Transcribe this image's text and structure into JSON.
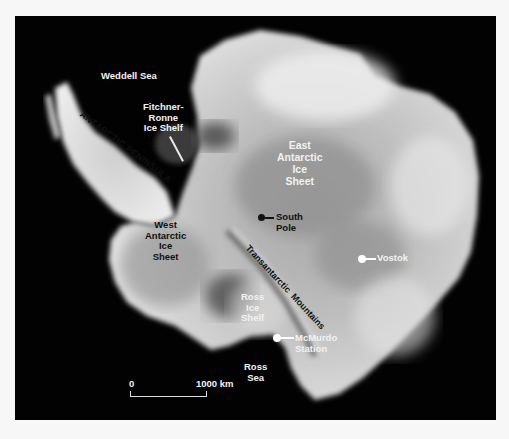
{
  "map": {
    "title": "Antarctica satellite mosaic",
    "colors": {
      "ocean": "#020202",
      "ice_light": "#e8e8e8",
      "ice_mid": "#9a9a9a",
      "ice_dark": "#555555",
      "page_bg": "#f7f7f7"
    },
    "labels": {
      "weddell_sea": "Weddell Sea",
      "fitchner_ronne": "Fitchner-\nRonne\nIce Shelf",
      "antarctic_peninsula": "ANTARCTIC PENINSULA",
      "east_antarctic": "East\nAntarctic\nIce\nSheet",
      "west_antarctic": "West\nAntarctic\nIce\nSheet",
      "transantarctic": "Transantarctic  Mountains",
      "ross_ice_shelf": "Ross\nIce\nShelf",
      "ross_sea": "Ross\nSea"
    },
    "markers": [
      {
        "name": "South Pole",
        "label": "South\nPole",
        "color": "#111111"
      },
      {
        "name": "Vostok",
        "label": "Vostok",
        "color": "#ffffff"
      },
      {
        "name": "McMurdo Station",
        "label": "McMurdo\nStation",
        "color": "#ffffff"
      }
    ],
    "scale_bar": {
      "start_label": "0",
      "end_label": "1000 km"
    }
  }
}
